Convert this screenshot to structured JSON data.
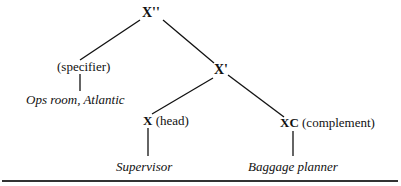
{
  "diagram": {
    "type": "x-bar syntax tree",
    "nodes": {
      "root": {
        "label": "X''"
      },
      "specifier": {
        "label": "(specifier)"
      },
      "specifier_leaf": {
        "label": "Ops room, Atlantic"
      },
      "xbar": {
        "label": "X'"
      },
      "head": {
        "symbol": "X",
        "role": "(head)"
      },
      "head_leaf": {
        "label": "Supervisor"
      },
      "complement": {
        "symbol": "XC",
        "role": "(complement)"
      },
      "complement_leaf": {
        "label": "Baggage planner"
      }
    },
    "edges": [
      [
        "root",
        "specifier"
      ],
      [
        "root",
        "xbar"
      ],
      [
        "specifier",
        "specifier_leaf"
      ],
      [
        "xbar",
        "head"
      ],
      [
        "xbar",
        "complement"
      ],
      [
        "head",
        "head_leaf"
      ],
      [
        "complement",
        "complement_leaf"
      ]
    ]
  }
}
